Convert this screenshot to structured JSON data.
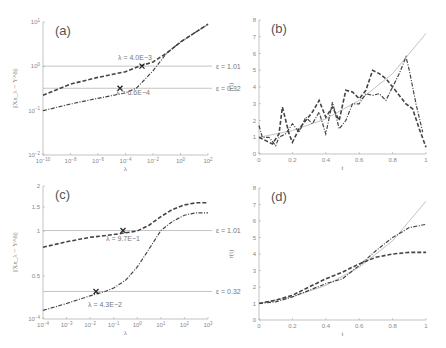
{
  "chart_data": [
    {
      "id": "a",
      "type": "line",
      "panel_label": "(a)",
      "xlabel": "λ",
      "ylabel": "||Xx_λ − Y^δ||",
      "xscale": "log",
      "yscale": "log",
      "x_ticks": [
        "10^-10",
        "10^-8",
        "10^-6",
        "10^-4",
        "10^-2",
        "10^0",
        "10^2"
      ],
      "y_ticks": [
        "10^-2",
        "10^-1",
        "10^0",
        "10^1"
      ],
      "hlines": [
        {
          "label": "ε = 1.01",
          "value": 1.01
        },
        {
          "label": "ε = 0.32",
          "value": 0.32
        }
      ],
      "annotations": [
        {
          "text": "λ = 4.0E−3",
          "x": 0.004
        },
        {
          "text": "λ = 6.6E−4",
          "x": 0.00066
        }
      ],
      "series": [
        {
          "name": "dashed",
          "style": "dashed",
          "x_log": [
            -10,
            -8,
            -6,
            -4,
            -3,
            -2,
            -1,
            0,
            2
          ],
          "y_log": [
            -0.65,
            -0.4,
            -0.25,
            -0.12,
            0,
            0.1,
            0.3,
            0.55,
            0.95
          ]
        },
        {
          "name": "dash-dot",
          "style": "dashdot",
          "x_log": [
            -10,
            -8,
            -6,
            -4,
            -3.2,
            -2,
            -1,
            0,
            2
          ],
          "y_log": [
            -1.0,
            -0.85,
            -0.72,
            -0.6,
            -0.49,
            -0.1,
            0.3,
            0.55,
            0.95
          ]
        }
      ]
    },
    {
      "id": "b",
      "type": "line",
      "panel_label": "(b)",
      "xlabel": "t",
      "ylabel": "r(t)",
      "xlim": [
        0,
        1
      ],
      "ylim": [
        0,
        8
      ],
      "x_ticks": [
        "0",
        "0.2",
        "0.4",
        "0.6",
        "0.8",
        "1"
      ],
      "y_ticks": [
        "0",
        "1",
        "2",
        "3",
        "4",
        "5",
        "6",
        "7",
        "8"
      ],
      "series": [
        {
          "name": "true",
          "style": "solid",
          "x": [
            0,
            0.2,
            0.4,
            0.6,
            0.8,
            1
          ],
          "y": [
            1,
            1.4,
            2.1,
            3.2,
            4.8,
            7.2
          ]
        },
        {
          "name": "dashed",
          "style": "dashed",
          "x": [
            0,
            0.04,
            0.08,
            0.12,
            0.14,
            0.18,
            0.2,
            0.24,
            0.28,
            0.32,
            0.36,
            0.4,
            0.44,
            0.48,
            0.52,
            0.56,
            0.6,
            0.64,
            0.68,
            0.72,
            0.76,
            0.8,
            0.84,
            0.88,
            0.92,
            0.96,
            1
          ],
          "y": [
            1,
            0.8,
            0.6,
            1.2,
            2.8,
            1.2,
            0.7,
            1.5,
            2.0,
            2.5,
            3.2,
            2.2,
            2.8,
            2.0,
            3.8,
            3.7,
            3.3,
            3.8,
            5.0,
            4.8,
            4.5,
            4.0,
            3.5,
            3.0,
            2.7,
            1.5,
            0.4
          ]
        },
        {
          "name": "dash-dot",
          "style": "dashdot",
          "x": [
            0,
            0.02,
            0.06,
            0.1,
            0.12,
            0.16,
            0.2,
            0.24,
            0.28,
            0.32,
            0.36,
            0.4,
            0.44,
            0.48,
            0.52,
            0.56,
            0.6,
            0.64,
            0.68,
            0.72,
            0.76,
            0.8,
            0.84,
            0.88,
            0.9,
            0.94,
            0.98
          ],
          "y": [
            1.7,
            1.0,
            1.0,
            0.5,
            1.0,
            1.2,
            1.8,
            1.3,
            2.2,
            1.8,
            2.5,
            1.2,
            3.1,
            1.5,
            2.0,
            3.0,
            3.0,
            3.6,
            3.5,
            3.6,
            3.2,
            4.0,
            4.8,
            5.8,
            5.0,
            3.0,
            1.3
          ]
        }
      ]
    },
    {
      "id": "c",
      "type": "line",
      "panel_label": "(c)",
      "xlabel": "λ",
      "ylabel": "||Xx_λ − Y^δ||",
      "xscale": "log",
      "x_ticks": [
        "10^-4",
        "10^-3",
        "10^-2",
        "10^-1",
        "10^0",
        "10^1",
        "10^2",
        "10^3"
      ],
      "y_ticks": [
        "0.5",
        "1",
        "1.5",
        "2"
      ],
      "hlines": [
        {
          "label": "ε = 1.01",
          "value": 1.01
        },
        {
          "label": "ε = 0.32",
          "value": 0.32
        }
      ],
      "annotations": [
        {
          "text": "λ = 9.7E−1",
          "x": 0.97
        },
        {
          "text": "λ = 4.3E−2",
          "x": 0.043
        }
      ],
      "series": [
        {
          "name": "dashed",
          "style": "dashed",
          "x_log": [
            -4,
            -3,
            -2,
            -1,
            0,
            0.5,
            1,
            1.5,
            2,
            2.5,
            3
          ],
          "y": [
            0.82,
            0.88,
            0.93,
            0.96,
            1.0,
            1.12,
            1.3,
            1.45,
            1.55,
            1.6,
            1.6
          ]
        },
        {
          "name": "dash-dot",
          "style": "dashdot",
          "x_log": [
            -4,
            -3,
            -2,
            -1.37,
            -1,
            -0.5,
            0,
            0.5,
            1,
            1.5,
            2,
            2.5,
            3
          ],
          "y": [
            0.1,
            0.18,
            0.27,
            0.32,
            0.36,
            0.45,
            0.6,
            0.8,
            1.01,
            1.2,
            1.33,
            1.38,
            1.38
          ]
        }
      ]
    },
    {
      "id": "d",
      "type": "line",
      "panel_label": "(d)",
      "xlabel": "t",
      "ylabel": "r(t)",
      "xlim": [
        0,
        1
      ],
      "ylim": [
        0,
        8
      ],
      "x_ticks": [
        "0",
        "0.2",
        "0.4",
        "0.6",
        "0.8",
        "1"
      ],
      "y_ticks": [
        "0",
        "1",
        "2",
        "3",
        "4",
        "5",
        "6",
        "7",
        "8"
      ],
      "series": [
        {
          "name": "true",
          "style": "solid",
          "x": [
            0,
            0.2,
            0.4,
            0.6,
            0.8,
            1
          ],
          "y": [
            1,
            1.4,
            2.1,
            3.2,
            4.8,
            7.2
          ]
        },
        {
          "name": "dashed",
          "style": "dashed",
          "x": [
            0,
            0.1,
            0.2,
            0.3,
            0.4,
            0.5,
            0.6,
            0.7,
            0.8,
            0.9,
            1
          ],
          "y": [
            1,
            1.2,
            1.5,
            2.0,
            2.5,
            2.9,
            3.4,
            3.8,
            4.0,
            4.1,
            4.1
          ]
        },
        {
          "name": "dash-dot",
          "style": "dashdot",
          "x": [
            0,
            0.1,
            0.2,
            0.3,
            0.4,
            0.5,
            0.6,
            0.7,
            0.8,
            0.9,
            1
          ],
          "y": [
            1,
            1.1,
            1.4,
            1.8,
            2.2,
            2.5,
            3.3,
            4.2,
            5.0,
            5.6,
            5.8
          ]
        }
      ]
    }
  ]
}
